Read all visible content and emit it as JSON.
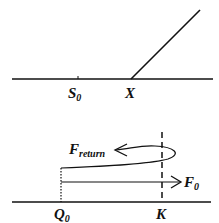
{
  "top_diagram": {
    "labels": {
      "s": "S",
      "s_sub": "0",
      "x": "X"
    }
  },
  "bottom_diagram": {
    "labels": {
      "f_return": "F",
      "f_return_sub": "return",
      "f0": "F",
      "f0_sub": "0",
      "q": "Q",
      "q_sub": "0",
      "k": "K"
    }
  },
  "colors": {
    "line": "#111111",
    "background": "#ffffff"
  }
}
